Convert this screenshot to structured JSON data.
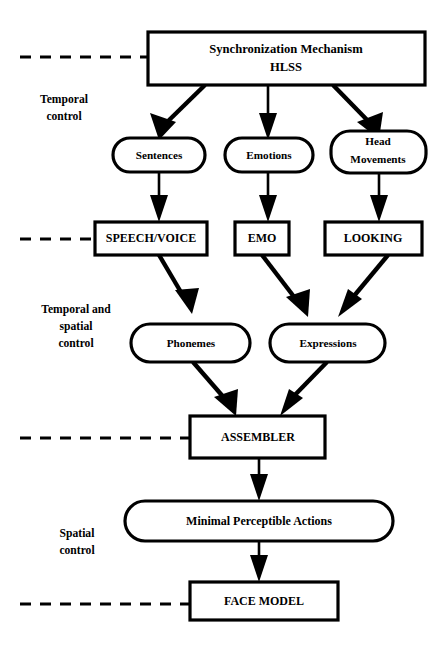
{
  "diagram": {
    "colors": {
      "background": "#ffffff",
      "stroke": "#000000",
      "fill": "#ffffff"
    },
    "nodes": {
      "root": {
        "id": "synchronization-mechanism",
        "shape": "rectangle",
        "line1": "Synchronization Mechanism",
        "line2": "HLSS"
      },
      "sentences": {
        "id": "sentences",
        "shape": "rounded",
        "label": "Sentences"
      },
      "emotions": {
        "id": "emotions",
        "shape": "rounded",
        "label": "Emotions"
      },
      "head_movements": {
        "id": "head-movements",
        "shape": "rounded",
        "line1": "Head",
        "line2": "Movements"
      },
      "speech_voice": {
        "id": "speech-voice",
        "shape": "rectangle",
        "label": "SPEECH/VOICE"
      },
      "emo": {
        "id": "emo",
        "shape": "rectangle",
        "label": "EMO"
      },
      "looking": {
        "id": "looking",
        "shape": "rectangle",
        "label": "LOOKING"
      },
      "phonemes": {
        "id": "phonemes",
        "shape": "rounded",
        "label": "Phonemes"
      },
      "expressions": {
        "id": "expressions",
        "shape": "rounded",
        "label": "Expressions"
      },
      "assembler": {
        "id": "assembler",
        "shape": "rectangle",
        "label": "ASSEMBLER"
      },
      "minimal_perceptible_actions": {
        "id": "minimal-perceptible-actions",
        "shape": "stadium",
        "label": "Minimal Perceptible Actions"
      },
      "face_model": {
        "id": "face-model",
        "shape": "rectangle",
        "label": "FACE MODEL"
      }
    },
    "side_labels": {
      "temporal": {
        "line1": "Temporal",
        "line2": "control"
      },
      "temporal_spatial": {
        "line1": "Temporal and",
        "line2": "spatial",
        "line3": "control"
      },
      "spatial": {
        "line1": "Spatial",
        "line2": "control"
      }
    },
    "edges": [
      {
        "from": "synchronization-mechanism",
        "to": "sentences"
      },
      {
        "from": "synchronization-mechanism",
        "to": "emotions"
      },
      {
        "from": "synchronization-mechanism",
        "to": "head-movements"
      },
      {
        "from": "sentences",
        "to": "speech-voice"
      },
      {
        "from": "emotions",
        "to": "emo"
      },
      {
        "from": "head-movements",
        "to": "looking"
      },
      {
        "from": "speech-voice",
        "to": "phonemes"
      },
      {
        "from": "emo",
        "to": "expressions"
      },
      {
        "from": "looking",
        "to": "expressions"
      },
      {
        "from": "phonemes",
        "to": "assembler"
      },
      {
        "from": "expressions",
        "to": "assembler"
      },
      {
        "from": "assembler",
        "to": "minimal-perceptible-actions"
      },
      {
        "from": "minimal-perceptible-actions",
        "to": "face-model"
      }
    ],
    "guide_lines": [
      {
        "id": "guide-temporal-top",
        "y": 57
      },
      {
        "id": "guide-temporal-bottom",
        "y": 239
      },
      {
        "id": "guide-spatial-top",
        "y": 438
      },
      {
        "id": "guide-spatial-bottom",
        "y": 604
      }
    ]
  }
}
